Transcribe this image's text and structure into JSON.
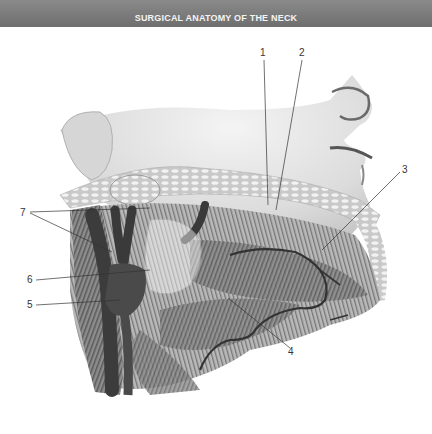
{
  "header": {
    "title": "SURGICAL ANATOMY OF THE NECK",
    "background_color": "#787878"
  },
  "figure": {
    "labels": [
      {
        "id": "label-1",
        "text": "1"
      },
      {
        "id": "label-2",
        "text": "2"
      },
      {
        "id": "label-3",
        "text": "3"
      },
      {
        "id": "label-4",
        "text": "4"
      },
      {
        "id": "label-5",
        "text": "5"
      },
      {
        "id": "label-6",
        "text": "6"
      },
      {
        "id": "label-7",
        "text": "7"
      }
    ]
  }
}
